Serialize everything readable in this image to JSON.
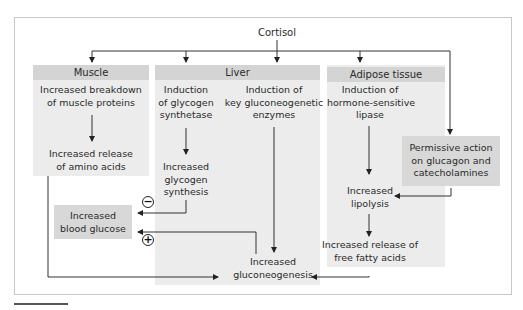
{
  "title": "Cortisol",
  "sections": {
    "muscle": {
      "header": "Muscle",
      "step1": [
        "Increased breakdown",
        "of muscle proteins"
      ],
      "step2": [
        "Increased release",
        "of amino acids"
      ]
    },
    "liver": {
      "header": "Liver",
      "left_step1": [
        "Induction",
        "of glycogen",
        "synthetase"
      ],
      "left_step2": [
        "Increased",
        "glycogen",
        "synthesis"
      ],
      "right_step1": [
        "Induction of",
        "key gluconeogenetic",
        "enzymes"
      ],
      "result": [
        "Increased",
        "gluconeogenesis"
      ]
    },
    "adipose": {
      "header": "Adipose tissue",
      "step1": [
        "Induction of",
        "hormone-sensitive",
        "lipase"
      ],
      "step2": [
        "Increased",
        "lipolysis"
      ],
      "step3": [
        "Increased release of",
        "free fatty acids"
      ]
    },
    "permissive": [
      "Permissive action",
      "on glucagon and",
      "catecholamines"
    ],
    "blood_glucose": [
      "Increased",
      "blood glucose"
    ]
  },
  "signs": {
    "minus": "−",
    "plus": "+"
  },
  "colors": {
    "panel": "#ececec",
    "header": "#d4d4d4",
    "box": "#d8d8d8",
    "line": "#333333"
  }
}
